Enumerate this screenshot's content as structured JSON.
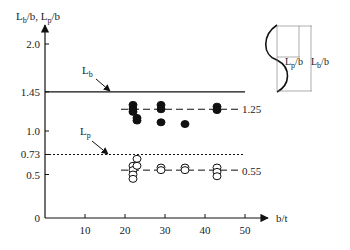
{
  "chart_data": {
    "type": "scatter",
    "title": "",
    "xlabel": "b/t",
    "ylabel": "L_b/b, L_p/b",
    "xlim": [
      0,
      55
    ],
    "ylim": [
      0,
      2.2
    ],
    "x_ticks": [
      10,
      20,
      30,
      40,
      50
    ],
    "y_ticks": [
      "0",
      "0.5",
      "0.73",
      "1.0",
      "1.45",
      "2.0"
    ],
    "grid": false,
    "reference_lines": [
      {
        "name": "L_b",
        "y": 1.45,
        "style": "solid"
      },
      {
        "name": "L_p",
        "y": 0.73,
        "style": "dotted"
      },
      {
        "name": "mean L_b/b",
        "y": 1.25,
        "style": "dashed",
        "label": "1.25"
      },
      {
        "name": "mean L_p/b",
        "y": 0.55,
        "style": "dashed",
        "label": "0.55"
      }
    ],
    "series": [
      {
        "name": "L_b/b (filled)",
        "marker": "filled-circle",
        "points": [
          [
            22,
            1.3
          ],
          [
            22,
            1.25
          ],
          [
            22,
            1.22
          ],
          [
            23,
            1.15
          ],
          [
            23,
            1.12
          ],
          [
            29,
            1.3
          ],
          [
            29,
            1.25
          ],
          [
            29,
            1.1
          ],
          [
            35,
            1.08
          ],
          [
            43,
            1.28
          ],
          [
            43,
            1.24
          ]
        ]
      },
      {
        "name": "L_p/b (open)",
        "marker": "open-circle",
        "points": [
          [
            22,
            0.6
          ],
          [
            22,
            0.55
          ],
          [
            22,
            0.5
          ],
          [
            22,
            0.45
          ],
          [
            23,
            0.68
          ],
          [
            23,
            0.6
          ],
          [
            29,
            0.58
          ],
          [
            29,
            0.55
          ],
          [
            35,
            0.58
          ],
          [
            35,
            0.55
          ],
          [
            43,
            0.58
          ],
          [
            43,
            0.53
          ],
          [
            43,
            0.48
          ]
        ]
      }
    ],
    "annotations": [
      "L_b",
      "L_p",
      "1.25",
      "0.55"
    ],
    "inset": {
      "labels": [
        "L_p/b",
        "L_b/b"
      ],
      "description": "buckled plate profile with half-wave lengths"
    }
  },
  "labels": {
    "yaxis_title": "L_b/b, L_p/b",
    "xaxis_title": "b/t",
    "lb": "L",
    "lb_sub": "b",
    "lp": "L",
    "lp_sub": "p",
    "mean_upper": "1.25",
    "mean_lower": "0.55",
    "inset_lp": "L",
    "inset_lp_sub": "p",
    "inset_lp_suffix": "/b",
    "inset_lb": "L",
    "inset_lb_sub": "b",
    "inset_lb_suffix": "/b"
  }
}
